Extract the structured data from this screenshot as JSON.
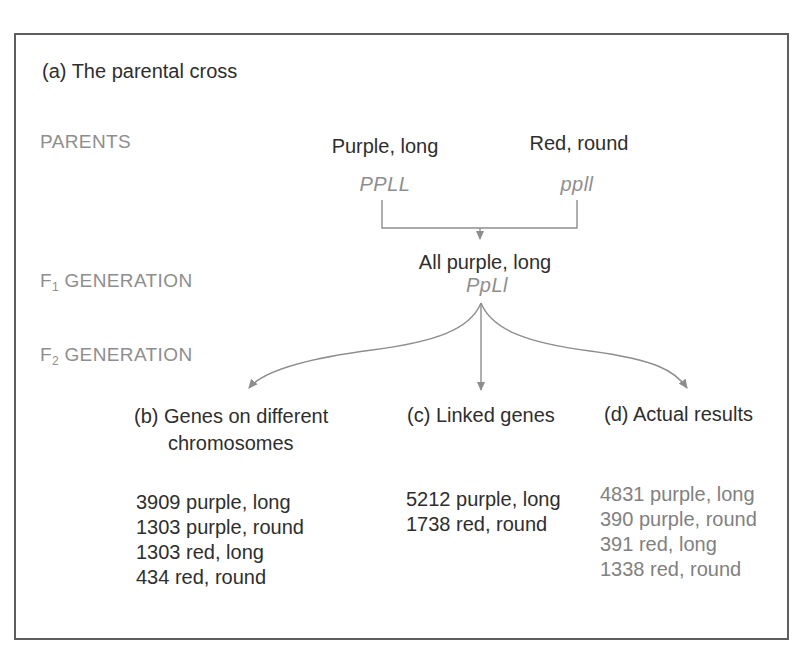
{
  "colors": {
    "background": "#ffffff",
    "text_black": "#2e2e2e",
    "text_gray": "#8e8e8e",
    "data_gray": "#818181",
    "line_gray": "#8d8d8d",
    "border_gray": "#5e5e5e"
  },
  "panel": {
    "title": "(a) The parental cross"
  },
  "row_labels": {
    "parents": "PARENTS",
    "f1": {
      "prefix": "F",
      "sub": "1",
      "rest": " GENERATION"
    },
    "f2": {
      "prefix": "F",
      "sub": "2",
      "rest": " GENERATION"
    }
  },
  "parents": {
    "left": {
      "phenotype": "Purple, long",
      "genotype": "PPLL"
    },
    "right": {
      "phenotype": "Red, round",
      "genotype": "ppll"
    }
  },
  "f1": {
    "phenotype": "All purple, long",
    "genotype": "PpLl"
  },
  "branches": {
    "b": {
      "label_line1": "(b) Genes on different",
      "label_line2": "chromosomes",
      "results": [
        "3909 purple, long",
        "1303 purple, round",
        "1303 red, long",
        "434 red, round"
      ]
    },
    "c": {
      "label": "(c) Linked genes",
      "results": [
        "5212 purple, long",
        "1738 red, round"
      ]
    },
    "d": {
      "label": "(d) Actual results",
      "results": [
        "4831 purple, long",
        "390 purple, round",
        "391 red, long",
        "1338 red, round"
      ]
    }
  }
}
